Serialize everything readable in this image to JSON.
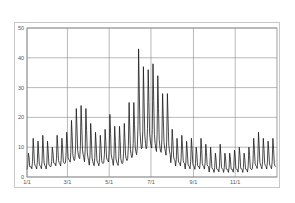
{
  "chart_data": {
    "type": "line",
    "title": "",
    "xlabel": "",
    "ylabel": "",
    "ylim": [
      0,
      50
    ],
    "yticks": [
      0,
      10,
      20,
      30,
      40,
      50
    ],
    "xticks": [
      "1/1",
      "3/1",
      "5/1",
      "7/1",
      "9/1",
      "11/1"
    ],
    "grid": true,
    "legend": null,
    "series": [
      {
        "name": "daily values (weekly peaks / troughs)",
        "color": "#1a1a1a",
        "weekly_peaks": [
          8,
          13,
          12,
          14,
          12,
          10,
          14,
          13,
          15,
          19,
          23,
          24,
          23,
          18,
          15,
          14,
          16,
          21,
          17,
          17,
          18,
          25,
          25,
          43,
          37,
          36,
          38,
          34,
          28,
          28,
          16,
          13,
          14,
          12,
          13,
          10,
          13,
          11,
          10,
          8,
          11,
          8,
          8,
          9,
          10,
          8,
          10,
          13,
          15,
          13,
          12,
          13
        ],
        "weekly_troughs": [
          3,
          3,
          3,
          3,
          3,
          4,
          4,
          4,
          5,
          5,
          6,
          6,
          5,
          4,
          4,
          4,
          5,
          5,
          4,
          4,
          5,
          6,
          7,
          9,
          9,
          10,
          9,
          8,
          8,
          7,
          5,
          4,
          4,
          3,
          3,
          3,
          3,
          3,
          2,
          2,
          2,
          2,
          2,
          2,
          2,
          2,
          2,
          3,
          3,
          3,
          3,
          3
        ]
      }
    ]
  }
}
